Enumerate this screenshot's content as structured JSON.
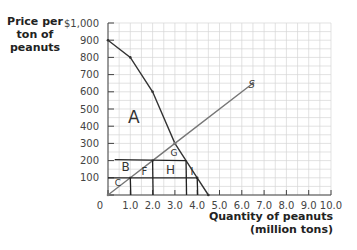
{
  "chart_data": {
    "type": "line",
    "title": "",
    "ylabel": "Price per ton of peanuts",
    "ylabel_lines": [
      "Price per",
      "ton of",
      "peanuts"
    ],
    "xlabel": "Quantity of peanuts (million tons)",
    "xlabel_lines": [
      "Quantity of peanuts",
      "(million tons)"
    ],
    "xlim": [
      0,
      10
    ],
    "ylim": [
      0,
      1000
    ],
    "x_ticks": [
      "0",
      "1.0",
      "2.0",
      "3.0",
      "4.0",
      "5.0",
      "6.0",
      "7.0",
      "8.0",
      "9.0",
      "10.0"
    ],
    "y_ticks": [
      "$1,000",
      "900",
      "800",
      "700",
      "600",
      "500",
      "400",
      "300",
      "200",
      "100"
    ],
    "grid": true,
    "series": [
      {
        "name": "Demand",
        "points": [
          [
            0,
            900
          ],
          [
            1,
            800
          ],
          [
            2,
            600
          ],
          [
            3,
            300
          ],
          [
            4,
            100
          ],
          [
            4.5,
            0
          ]
        ]
      },
      {
        "name": "Supply",
        "points": [
          [
            0,
            0
          ],
          [
            1,
            100
          ],
          [
            2,
            200
          ],
          [
            3,
            300
          ],
          [
            6.5,
            650
          ]
        ]
      }
    ],
    "annotations": {
      "horizontal_lines": [
        200,
        100
      ],
      "vertical_lines": [
        1.0,
        2.0,
        3.5,
        4.0
      ],
      "region_labels": [
        "A",
        "B",
        "C",
        "F",
        "G",
        "H",
        "I"
      ],
      "curve_label": "S"
    }
  }
}
